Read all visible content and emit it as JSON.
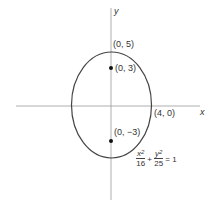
{
  "diagram": {
    "axes": {
      "x_label": "x",
      "y_label": "y"
    },
    "points": [
      {
        "label": "(0, 5)",
        "role": "vertex-top"
      },
      {
        "label": "(0, 3)",
        "role": "focus-upper"
      },
      {
        "label": "(4, 0)",
        "role": "co-vertex-right"
      },
      {
        "label": "(0, −3)",
        "role": "focus-lower"
      }
    ],
    "equation": {
      "term1_num": "x",
      "term1_num_exp": "2",
      "term1_den": "16",
      "plus": "+",
      "term2_num": "y",
      "term2_num_exp": "2",
      "term2_den": "25",
      "equals": "= 1"
    },
    "colors": {
      "stroke": "#444444",
      "axis": "#888888",
      "text": "#333333"
    }
  }
}
